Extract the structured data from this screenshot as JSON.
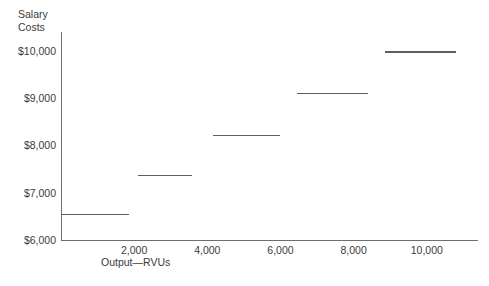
{
  "chart_data": {
    "type": "line",
    "subtype": "step",
    "title": "",
    "ylabel": "Salary\nCosts",
    "xlabel": "Output—RVUs",
    "grid": false,
    "legend": null,
    "xlim": [
      0,
      11400
    ],
    "ylim": [
      6000,
      10400
    ],
    "y_ticks": [
      {
        "label": "$6,000",
        "value": 6000
      },
      {
        "label": "$7,000",
        "value": 7000
      },
      {
        "label": "$8,000",
        "value": 8000
      },
      {
        "label": "$9,000",
        "value": 9000
      },
      {
        "label": "$10,000",
        "value": 10000
      }
    ],
    "x_ticks": [
      {
        "label": "2,000",
        "value": 2000
      },
      {
        "label": "4,000",
        "value": 4000
      },
      {
        "label": "6,000",
        "value": 6000
      },
      {
        "label": "8,000",
        "value": 8000
      },
      {
        "label": "10,000",
        "value": 10000
      }
    ],
    "steps": [
      {
        "x_start": 0,
        "x_end": 1850,
        "y": 6560
      },
      {
        "x_start": 2100,
        "x_end": 3580,
        "y": 7380
      },
      {
        "x_start": 4150,
        "x_end": 6000,
        "y": 8230
      },
      {
        "x_start": 6450,
        "x_end": 8400,
        "y": 9120
      },
      {
        "x_start": 8850,
        "x_end": 10800,
        "y": 10000
      }
    ],
    "colors": {
      "axis": "#6e6e6e",
      "series": "#5e5e5e",
      "text": "#3b3b3b",
      "background": "#ffffff"
    }
  }
}
